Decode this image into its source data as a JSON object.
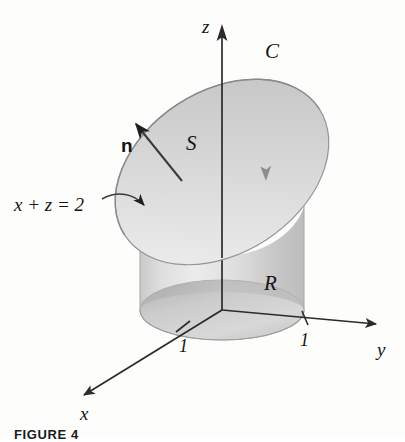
{
  "figure": {
    "caption": "FIGURE 4",
    "description_labels": {
      "axis_x": "x",
      "axis_y": "y",
      "axis_z": "z",
      "curve": "C",
      "surface": "S",
      "region": "R",
      "normal": "n",
      "plane_equation": "x + z = 2",
      "tick_x": "1",
      "tick_y": "1"
    },
    "colors": {
      "background": "#fdfdfc",
      "axis": "#2b2b2b",
      "surface_fill": "#d7d7d7",
      "surface_fill_light": "#e6e6e6",
      "cylinder_fill": "#dcdcdc",
      "disk_fill": "#cfcfcf",
      "disk_rim": "#b9b9b9",
      "outline": "#8d8d8d",
      "label_text": "#141414"
    },
    "geometry": {
      "origin": [
        222,
        310
      ],
      "z_axis_tip": [
        222,
        25
      ],
      "y_axis_tip": [
        383,
        325
      ],
      "x_axis_tip": [
        78,
        400
      ],
      "cylinder_radius_px": 82,
      "ellipse_minor_px": 30,
      "tick_x_pos": [
        182,
        326
      ],
      "tick_y_pos": [
        305,
        318
      ],
      "normal_arrow_from": [
        181,
        179
      ],
      "normal_arrow_to": [
        131,
        119
      ],
      "equation_arrow_from": [
        104,
        200
      ],
      "equation_arrow_to": [
        148,
        209
      ],
      "curve_orientation_arrow": [
        266,
        172
      ]
    }
  }
}
